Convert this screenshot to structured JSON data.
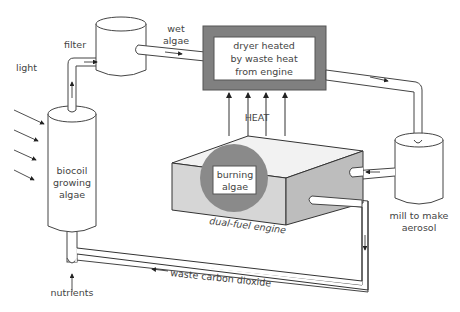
{
  "title_partial": "The diagram ... algae ...",
  "labels": {
    "light": "light",
    "filter": "filter",
    "wet_algae_1": "wet",
    "wet_algae_2": "algae",
    "dryer_1": "dryer heated",
    "dryer_2": "by waste heat",
    "dryer_3": "from engine",
    "heat": "HEAT",
    "burning_1": "burning",
    "burning_2": "algae",
    "engine": "dual-fuel engine",
    "biocoil_1": "biocoil",
    "biocoil_2": "growing",
    "biocoil_3": "algae",
    "mill_1": "mill to make",
    "mill_2": "aerosol",
    "nutrients": "nutrients",
    "waste_co2": "waste carbon dioxide"
  },
  "colors": {
    "dryer_frame": "#808080",
    "engine_front": "#d6d6d6",
    "engine_side": "#bdbdbd",
    "engine_top": "#f2f2f2",
    "burner_circle": "#8a8a8a"
  }
}
